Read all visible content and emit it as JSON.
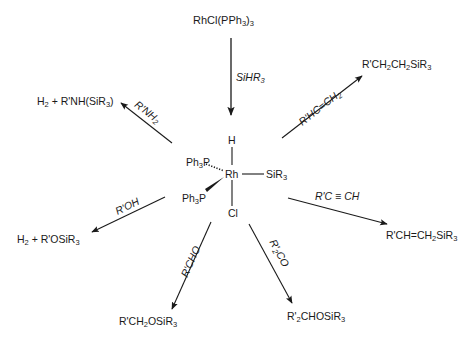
{
  "diagram": {
    "colors": {
      "ink": "#1a1a1a",
      "background": "#ffffff"
    },
    "precursor": {
      "name": "RhCl(PPh3)3",
      "parts": [
        "RhCl(PPh",
        "3",
        ")",
        "3"
      ]
    },
    "activation_reagent": {
      "name": "SiHR3",
      "parts": [
        "SiHR",
        "3"
      ]
    },
    "central_complex": {
      "metal": "Rh",
      "ligands": {
        "top": "H",
        "right": "SiR3",
        "right_parts": [
          "SiR",
          "3"
        ],
        "upper_left": "Ph3P",
        "upper_left_parts": [
          "Ph",
          "3",
          "P"
        ],
        "lower_left": "Ph3P",
        "lower_left_parts": [
          "Ph",
          "3",
          "P"
        ],
        "bottom": "Cl"
      }
    },
    "reactions": [
      {
        "id": "amine",
        "reagent": "R'NH2",
        "reagent_parts": [
          "R'NH",
          "2"
        ],
        "product": "H2 + R'NH(SiR3)",
        "product_parts": [
          "H",
          "2",
          " + R'NH(SiR",
          "3",
          ")"
        ]
      },
      {
        "id": "alkene",
        "reagent": "R'HC=CH2",
        "reagent_parts": [
          "R'HC=CH",
          "2"
        ],
        "product": "R'CH2CH2SiR3",
        "product_parts": [
          "R'CH",
          "2",
          "CH",
          "2",
          "SiR",
          "3"
        ]
      },
      {
        "id": "alkyne",
        "reagent": "R'C≡CH",
        "reagent_parts": [
          "R'C ",
          "≡",
          " CH"
        ],
        "product": "R'CH=CH2SiR3",
        "product_parts": [
          "R'CH=CH",
          "2",
          "SiR",
          "3"
        ]
      },
      {
        "id": "alcohol",
        "reagent": "R'OH",
        "product": "H2 + R'OSiR3",
        "product_parts": [
          "H",
          "2",
          " + R'OSiR",
          "3"
        ]
      },
      {
        "id": "aldehyde",
        "reagent": "R'CHO",
        "product": "R'CH2OSiR3",
        "product_parts": [
          "R'CH",
          "2",
          "OSiR",
          "3"
        ]
      },
      {
        "id": "ketone",
        "reagent": "R'2CO",
        "reagent_parts": [
          "R'",
          "2",
          "CO"
        ],
        "product": "R'2CHOSiR3",
        "product_parts": [
          "R'",
          "2",
          "CHOSiR",
          "3"
        ]
      }
    ]
  }
}
